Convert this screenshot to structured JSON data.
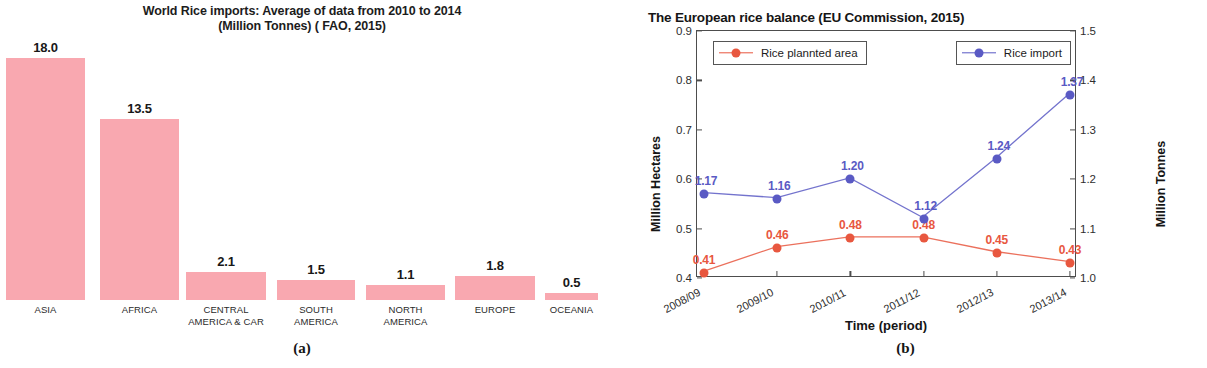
{
  "figure": {
    "caption_a": "(a)",
    "caption_b": "(b)"
  },
  "colors": {
    "bar_fill": "#f9a8b0",
    "planted_area": "#e8573f",
    "rice_import": "#5a5ac4",
    "axis": "#4d4d4d",
    "text": "#1a1a1a"
  },
  "chart_data": [
    {
      "type": "bar",
      "title": "World Rice imports: Average of data from 2010 to 2014 (Million Tonnes) ( FAO, 2015)",
      "title_line1": "World Rice imports: Average of data from 2010 to 2014",
      "title_line2": "(Million Tonnes) ( FAO, 2015)",
      "xlabel": "",
      "ylabel": "",
      "ylim": [
        0,
        18
      ],
      "grid": false,
      "legend": "none",
      "categories": [
        "ASIA",
        "AFRICA",
        "CENTRAL AMERICA & CAR",
        "SOUTH AMERICA",
        "NORTH AMERICA",
        "EUROPE",
        "OCEANIA"
      ],
      "category_lines": [
        [
          "ASIA"
        ],
        [
          "AFRICA"
        ],
        [
          "CENTRAL",
          "AMERICA & CAR"
        ],
        [
          "SOUTH",
          "AMERICA"
        ],
        [
          "NORTH",
          "AMERICA"
        ],
        [
          "EUROPE"
        ],
        [
          "OCEANIA"
        ]
      ],
      "values": [
        18.0,
        13.5,
        2.1,
        1.5,
        1.1,
        1.8,
        0.5
      ],
      "value_labels": [
        "18.0",
        "13.5",
        "2.1",
        "1.5",
        "1.1",
        "1.8",
        "0.5"
      ]
    },
    {
      "type": "line",
      "title": "The European rice balance (EU Commission, 2015)",
      "xlabel": "Time (period)",
      "ylabel_left": "Million Hectares",
      "ylabel_right": "Million Tonnes",
      "x": [
        "2008/09",
        "2009/10",
        "2010/11",
        "2011/12",
        "2012/13",
        "2013/14"
      ],
      "ylim_left": [
        0.4,
        0.9
      ],
      "ylim_right": [
        1.0,
        1.5
      ],
      "yticks_left": [
        "0.4",
        "0.5",
        "0.6",
        "0.7",
        "0.8",
        "0.9"
      ],
      "yticks_right": [
        "1.0",
        "1.1",
        "1.2",
        "1.3",
        "1.4",
        "1.5"
      ],
      "grid": false,
      "legend_position": "top",
      "series": [
        {
          "name": "Rice plannted area",
          "axis": "left",
          "unit": "Million Hectares",
          "color": "#e8573f",
          "values": [
            0.41,
            0.46,
            0.48,
            0.48,
            0.45,
            0.43
          ],
          "value_labels": [
            "0.41",
            "0.46",
            "0.48",
            "0.48",
            "0.45",
            "0.43"
          ]
        },
        {
          "name": "Rice import",
          "axis": "right",
          "unit": "Million Tonnes",
          "color": "#5a5ac4",
          "values": [
            1.17,
            1.16,
            1.2,
            1.12,
            1.24,
            1.37
          ],
          "value_labels": [
            "1.17",
            "1.16",
            "1.20",
            "1.12",
            "1.24",
            "1.37"
          ]
        }
      ]
    }
  ]
}
